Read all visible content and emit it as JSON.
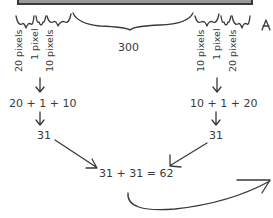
{
  "diagram": {
    "colors": {
      "box_fill": "#9a9a9a",
      "box_border": "#3a3a3a",
      "ink": "#3a3a3a",
      "background": "#ffffff"
    },
    "content_width_label": "300",
    "left_labels": [
      "20 pixels",
      "1 pixel",
      "10 pixels"
    ],
    "right_labels": [
      "10 pixels",
      "1 pixel",
      "20 pixels"
    ],
    "left_sum": "20 + 1 + 10",
    "right_sum": "10 + 1 + 20",
    "left_total": "31",
    "right_total": "31",
    "final_equation": "31 + 31 = 62"
  }
}
